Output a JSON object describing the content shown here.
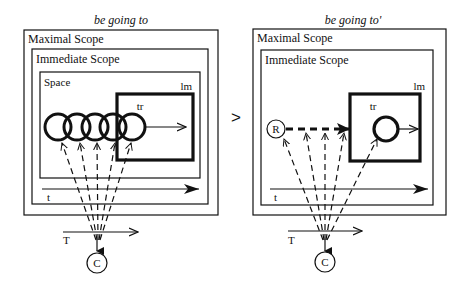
{
  "separator": ">",
  "colors": {
    "ink": "#111111",
    "background": "#ffffff"
  },
  "panels": [
    {
      "id": "left",
      "title": "be going to",
      "maximal_scope_label": "Maximal Scope",
      "immediate_scope_label": "Immediate Scope",
      "space_label": "Space",
      "landmark_label": "lm",
      "trajector_label": "tr",
      "time_label_inner": "t",
      "time_label_outer": "T",
      "conceptualizer_label": "C"
    },
    {
      "id": "right",
      "title": "be going to'",
      "maximal_scope_label": "Maximal Scope",
      "immediate_scope_label": "Immediate Scope",
      "landmark_label": "lm",
      "trajector_label": "tr",
      "reference_label": "R",
      "time_label_inner": "t",
      "time_label_outer": "T",
      "conceptualizer_label": "C"
    }
  ]
}
